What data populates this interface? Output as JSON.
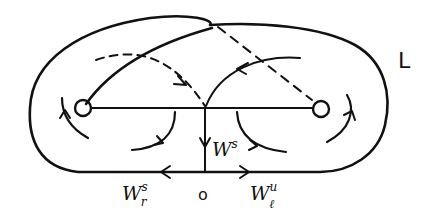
{
  "figure": {
    "type": "phase-portrait-sketch",
    "style": "hand-drawn",
    "colors": {
      "ink": "#111111",
      "background": "#ffffff"
    }
  },
  "labels": {
    "region": "L",
    "stable_vertical": {
      "base": "W",
      "sup": "s"
    },
    "stable_left": {
      "base": "W",
      "sup": "s",
      "sub": "r"
    },
    "unstable_right": {
      "base": "W",
      "sup": "u",
      "sub": "ℓ"
    },
    "origin": "o"
  },
  "elements": {
    "outer_boundary": "closed stadium-shaped curve",
    "left_equilibrium": "small circle (left)",
    "right_equilibrium": "small circle (right)",
    "connecting_line": "horizontal segment between circles",
    "vertical_manifold": "vertical line from center down to origin axis with downward arrow",
    "bottom_axis": "horizontal line through origin with left and right arrows",
    "crossing_arc_solid": "arc from left circle up to top-right",
    "crossing_arc_dashed": "dashed line from top to right circle",
    "inner_arc_left_dashed": "dashed arc with arrow toward center",
    "inner_arc_right_solid": "solid arc with arrow toward center",
    "swirl_arrows": 6
  }
}
